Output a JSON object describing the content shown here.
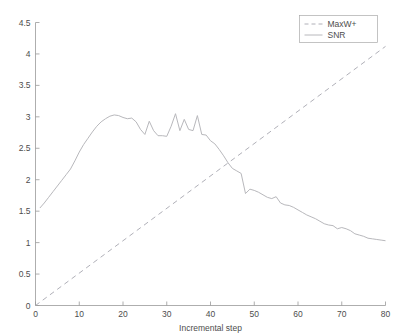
{
  "chart_data": {
    "type": "line",
    "title": "",
    "xlabel": "Incremental step",
    "ylabel": "",
    "xlim": [
      0,
      80
    ],
    "ylim": [
      0,
      4.5
    ],
    "xticks": [
      0,
      10,
      20,
      30,
      40,
      50,
      60,
      70,
      80
    ],
    "xticklabels": [
      "0",
      "10",
      "20",
      "30",
      "40",
      "50",
      "60",
      "70",
      "80"
    ],
    "yticks": [
      0,
      0.5,
      1,
      1.5,
      2,
      2.5,
      3,
      3.5,
      4,
      4.5
    ],
    "yticklabels": [
      "0",
      "0.5",
      "1",
      "1.5",
      "2",
      "2.5",
      "3",
      "3.5",
      "4",
      "4.5"
    ],
    "grid": false,
    "legend_position": "upper right",
    "series": [
      {
        "name": "MaxW+",
        "style": "dashed",
        "color": "#b0b0b8",
        "x": [
          0,
          80
        ],
        "values": [
          0,
          4.12
        ]
      },
      {
        "name": "SNR",
        "style": "solid",
        "color": "#b8b8bc",
        "x": [
          1,
          2,
          3,
          4,
          5,
          6,
          7,
          8,
          9,
          10,
          11,
          12,
          13,
          14,
          15,
          16,
          17,
          18,
          19,
          20,
          21,
          22,
          23,
          24,
          25,
          26,
          27,
          28,
          29,
          30,
          31,
          32,
          33,
          34,
          35,
          36,
          37,
          38,
          39,
          40,
          41,
          42,
          43,
          44,
          45,
          46,
          47,
          48,
          49,
          50,
          51,
          52,
          53,
          54,
          55,
          56,
          57,
          58,
          59,
          60,
          61,
          62,
          63,
          64,
          65,
          66,
          67,
          68,
          69,
          70,
          71,
          72,
          73,
          74,
          75,
          76,
          77,
          78,
          79,
          80
        ],
        "values": [
          1.55,
          1.63,
          1.72,
          1.81,
          1.9,
          1.99,
          2.08,
          2.17,
          2.3,
          2.44,
          2.56,
          2.66,
          2.76,
          2.85,
          2.92,
          2.97,
          3.01,
          3.03,
          3.02,
          2.99,
          2.97,
          2.98,
          2.92,
          2.8,
          2.72,
          2.93,
          2.78,
          2.7,
          2.7,
          2.69,
          2.85,
          3.05,
          2.78,
          2.96,
          2.8,
          2.78,
          3.02,
          2.72,
          2.71,
          2.62,
          2.57,
          2.48,
          2.38,
          2.27,
          2.18,
          2.14,
          2.1,
          1.78,
          1.85,
          1.83,
          1.8,
          1.76,
          1.72,
          1.7,
          1.73,
          1.63,
          1.6,
          1.59,
          1.56,
          1.52,
          1.48,
          1.44,
          1.41,
          1.38,
          1.34,
          1.3,
          1.28,
          1.27,
          1.22,
          1.24,
          1.22,
          1.19,
          1.14,
          1.12,
          1.1,
          1.07,
          1.06,
          1.05,
          1.04,
          1.03
        ]
      }
    ],
    "legend": [
      {
        "label": "MaxW+",
        "style": "dashed"
      },
      {
        "label": "SNR",
        "style": "solid"
      }
    ]
  },
  "axes": {
    "colors": {
      "axis": "#999999",
      "text": "#4d4d4d",
      "snr": "#b8b8bc",
      "maxw": "#b0b0b8",
      "legend_border": "#aaaaaa"
    }
  }
}
